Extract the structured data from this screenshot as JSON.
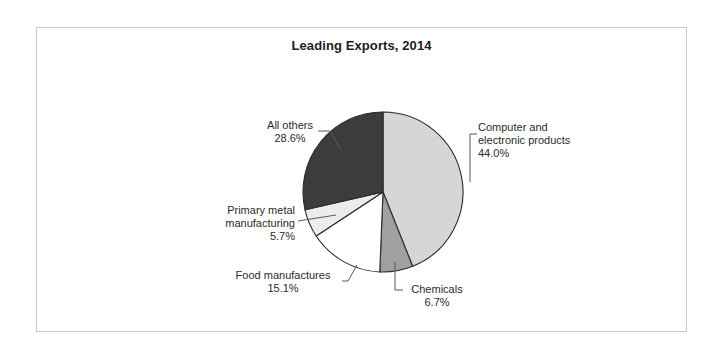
{
  "figure": {
    "title": "Leading Exports, 2014",
    "frame_color": "#c9c9c9",
    "background": "#ffffff",
    "text_color": "#2b2b2b"
  },
  "labels": {
    "computer": {
      "line1": "Computer and",
      "line2": "electronic products",
      "pct": "44.0%"
    },
    "all_others": {
      "line1": "All others",
      "pct": "28.6%"
    },
    "primary_metal": {
      "line1": "Primary metal",
      "line2": "manufacturing",
      "pct": "5.7%"
    },
    "food": {
      "line1": "Food manufactures",
      "pct": "15.1%"
    },
    "chemicals": {
      "line1": "Chemicals",
      "pct": "6.7%"
    }
  },
  "chart_data": {
    "type": "pie",
    "title": "Leading Exports, 2014",
    "xlabel": "",
    "ylabel": "",
    "grid": false,
    "legend_position": "none",
    "label_style": "callout labels with leader lines outside the pie",
    "units": "percent of total exports",
    "start_angle_deg": 90,
    "direction": "clockwise",
    "center_px": [
      383,
      192
    ],
    "radius_px": 80,
    "total": 100.1,
    "categories": [
      "Computer and electronic products",
      "Chemicals",
      "Food manufactures",
      "Primary metal manufacturing",
      "All others"
    ],
    "values": [
      44.0,
      6.7,
      15.1,
      5.7,
      28.6
    ],
    "slices": [
      {
        "label": "Computer and electronic products",
        "value": 44.0,
        "value_text": "44.0%",
        "color": "#d6d6d6",
        "start_deg": 0.0,
        "end_deg": 158.4
      },
      {
        "label": "Chemicals",
        "value": 6.7,
        "value_text": "6.7%",
        "color": "#a0a0a0",
        "start_deg": 158.4,
        "end_deg": 182.5
      },
      {
        "label": "Food manufactures",
        "value": 15.1,
        "value_text": "15.1%",
        "color": "#ffffff",
        "start_deg": 182.5,
        "end_deg": 236.9
      },
      {
        "label": "Primary metal manufacturing",
        "value": 5.7,
        "value_text": "5.7%",
        "color": "#ececec",
        "start_deg": 236.9,
        "end_deg": 257.4
      },
      {
        "label": "All others",
        "value": 28.6,
        "value_text": "28.6%",
        "color": "#3c3c3c",
        "start_deg": 257.4,
        "end_deg": 360.0
      }
    ]
  }
}
